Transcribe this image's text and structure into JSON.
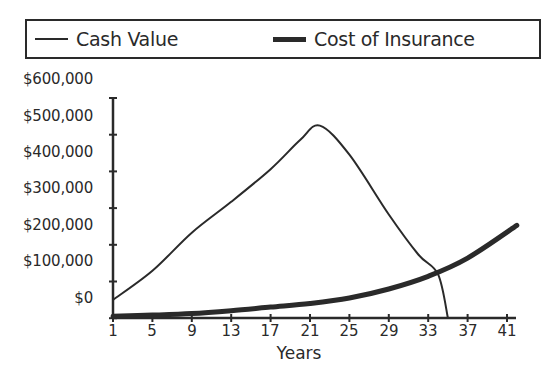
{
  "chart_data": {
    "type": "line",
    "title": "",
    "xlabel": "Years",
    "ylabel": "",
    "x_ticks": [
      1,
      5,
      9,
      13,
      17,
      21,
      25,
      29,
      33,
      37,
      41
    ],
    "y_tick_labels": [
      "$600,000",
      "$500,000",
      "$400,000",
      "$300,000",
      "$200,000",
      "$100,000",
      "$0"
    ],
    "ylim": [
      0,
      600000
    ],
    "xlim": [
      1,
      42
    ],
    "grid": false,
    "legend_position": "top",
    "series": [
      {
        "name": "Cash Value",
        "style": "thin",
        "x": [
          1,
          5,
          9,
          13,
          17,
          20,
          22,
          25,
          29,
          32,
          34,
          35
        ],
        "values": [
          50000,
          130000,
          235000,
          320000,
          410000,
          490000,
          530000,
          450000,
          285000,
          175000,
          120000,
          0
        ]
      },
      {
        "name": "Cost of Insurance",
        "style": "thick",
        "x": [
          1,
          5,
          9,
          13,
          17,
          21,
          25,
          29,
          33,
          37,
          42
        ],
        "values": [
          5000,
          8000,
          12000,
          20000,
          30000,
          40000,
          55000,
          80000,
          115000,
          165000,
          255000
        ]
      }
    ]
  },
  "legend": {
    "items": [
      {
        "label": "Cash Value"
      },
      {
        "label": "Cost of Insurance"
      }
    ]
  },
  "axes": {
    "x_title": "Years",
    "y_labels": [
      "$600,000",
      "$500,000",
      "$400,000",
      "$300,000",
      "$200,000",
      "$100,000",
      "$0"
    ],
    "x_labels": [
      "1",
      "5",
      "9",
      "13",
      "17",
      "21",
      "25",
      "29",
      "33",
      "37",
      "41"
    ]
  },
  "colors": {
    "ink": "#2a2a2a",
    "background": "#ffffff"
  }
}
